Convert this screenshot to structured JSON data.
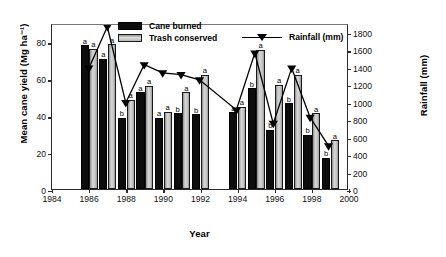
{
  "chart_data": {
    "type": "bar",
    "title": "",
    "xlabel": "Year",
    "ylabel": "Mean cane yield (Mg ha⁻¹)",
    "y2label": "Rainfall (mm)",
    "xlim": [
      1984,
      2000
    ],
    "ylim": [
      0,
      90
    ],
    "y2lim": [
      0,
      1900
    ],
    "grid": false,
    "legend_position": "top-center",
    "xticks": [
      "1984",
      "1986",
      "1988",
      "1990",
      "1992",
      "1994",
      "1996",
      "1998",
      "2000"
    ],
    "yticks": [
      "0",
      "20",
      "40",
      "60",
      "80"
    ],
    "y2ticks": [
      "0",
      "200",
      "400",
      "600",
      "800",
      "1000",
      "1200",
      "1400",
      "1600",
      "1800"
    ],
    "categories": [
      1986,
      1987,
      1988,
      1989,
      1990,
      1991,
      1992,
      1994,
      1995,
      1996,
      1997,
      1998,
      1999
    ],
    "series": [
      {
        "name": "Cane burned",
        "color": "#0d0d0d",
        "axis": "left",
        "values": [
          78,
          70.5,
          38.5,
          52.5,
          38.5,
          41,
          40.5,
          41.5,
          54.5,
          32,
          46.5,
          29.5,
          17
        ],
        "letters": [
          "a",
          "a",
          "b",
          "a",
          "a",
          "b",
          "b",
          "a",
          "b",
          "b",
          "b",
          "b",
          "b"
        ]
      },
      {
        "name": "Trash conserved",
        "color": "#b9b9b9",
        "axis": "left",
        "values": [
          76,
          78.5,
          48.5,
          56,
          42,
          52.5,
          62,
          44.5,
          75.5,
          56.5,
          62,
          41,
          26.5
        ],
        "letters": [
          "a",
          "a",
          "a",
          "a",
          "a",
          "a",
          "a",
          "a",
          "a",
          "a",
          "a",
          "a",
          "a"
        ]
      },
      {
        "name": "Rainfall (mm)",
        "color": "#000000",
        "axis": "right",
        "marker": "triangle-down",
        "values": [
          1400,
          1880,
          1000,
          1440,
          1345,
          1325,
          1265,
          915,
          1575,
          760,
          1400,
          830,
          500
        ]
      }
    ]
  },
  "legend": {
    "cane_burned": "Cane burned",
    "trash_conserved": "Trash conserved",
    "rainfall": "Rainfall (mm)"
  },
  "axes": {
    "y_left_title": "Mean cane yield (Mg ha⁻¹)",
    "y_right_title": "Rainfall (mm)",
    "x_title": "Year"
  }
}
